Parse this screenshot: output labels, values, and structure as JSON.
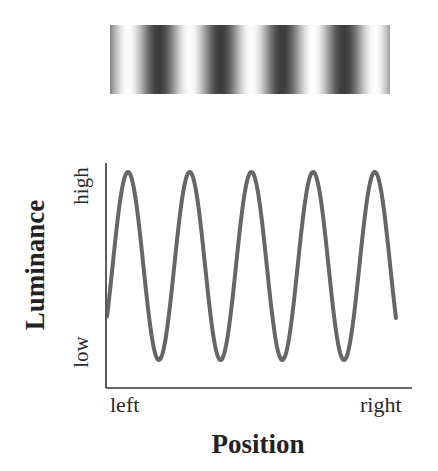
{
  "figure": {
    "grating_label": "sinusoidal grating",
    "colors": {
      "axis": "#333333",
      "curve": "#555555",
      "grating_dark": "#3a3a3a",
      "grating_light": "#ffffff",
      "text": "#222222"
    }
  },
  "chart_data": {
    "type": "line",
    "title": "",
    "xlabel": "Position",
    "ylabel": "Luminance",
    "x_tick_labels": [
      "left",
      "right"
    ],
    "y_tick_labels": [
      "low",
      "high"
    ],
    "grid": false,
    "legend": null,
    "cycles_shown": 4.5,
    "peaks": 5,
    "troughs": 4,
    "series": [
      {
        "name": "Luminance profile",
        "function": "sinusoid",
        "period_px": 61.7,
        "first_peak_x_px": 128,
        "center_y_px": 266,
        "amplitude_px": 94,
        "x_start_px": 107,
        "x_end_px": 396,
        "peaks_x_px": [
          128,
          189,
          251,
          313,
          375
        ],
        "troughs_x_px": [
          157,
          219,
          282,
          344
        ]
      }
    ],
    "normalized_points": [
      {
        "x": 0.0,
        "y": 0.23
      },
      {
        "x": 0.07,
        "y": 1.0
      },
      {
        "x": 0.18,
        "y": 0.0
      },
      {
        "x": 0.28,
        "y": 1.0
      },
      {
        "x": 0.39,
        "y": 0.0
      },
      {
        "x": 0.5,
        "y": 1.0
      },
      {
        "x": 0.61,
        "y": 0.0
      },
      {
        "x": 0.71,
        "y": 1.0
      },
      {
        "x": 0.82,
        "y": 0.0
      },
      {
        "x": 0.93,
        "y": 1.0
      },
      {
        "x": 1.0,
        "y": 0.2
      }
    ],
    "axes": {
      "origin_px": [
        106,
        388
      ],
      "y_top_px": 163,
      "x_right_px": 412
    }
  }
}
